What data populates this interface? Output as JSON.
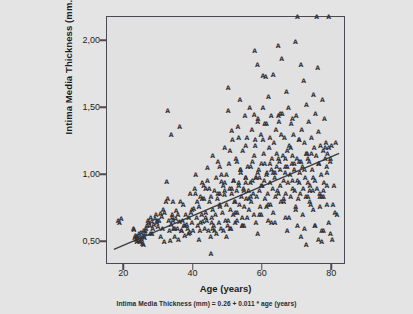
{
  "figure": {
    "background_color": "#e4e4e4",
    "plot_background_color": "#e1e1e1",
    "frame_color": "#4a4a52",
    "marker_color": "#32323a",
    "marker_glyph": "A",
    "caption": "Intima Media Thickness (mm) = 0.26 + 0.011 * age (years)"
  },
  "chart_data": {
    "type": "scatter",
    "title": "",
    "xlabel": "Age (years)",
    "ylabel": "Intima Media Thickness (mm.)",
    "xlim": [
      15,
      84
    ],
    "ylim": [
      0.33,
      2.18
    ],
    "xticks": [
      20,
      40,
      60,
      80
    ],
    "xtick_labels": [
      "20",
      "40",
      "60",
      "80"
    ],
    "yticks": [
      0.5,
      1.0,
      1.5,
      2.0
    ],
    "ytick_labels": [
      "0,50",
      "1,00",
      "1,50",
      "2,00"
    ],
    "grid": false,
    "legend": null,
    "marker": "A",
    "annotations": [
      "Intima Media Thickness (mm) = 0.26 + 0.011 * age (years)"
    ],
    "fit_line": {
      "type": "linear-regression",
      "intercept": 0.26,
      "slope": 0.011,
      "equation": "Intima Media Thickness (mm) = 0.26 + 0.011 * age (years)",
      "x_start": 17,
      "x_end": 82,
      "y_start": 0.447,
      "y_end": 1.162
    },
    "x": [
      18.2,
      18.6,
      19.1,
      22.6,
      22.8,
      23.0,
      23.2,
      23.4,
      23.6,
      23.8,
      24.0,
      24.2,
      24.4,
      24.6,
      24.8,
      25.0,
      25.2,
      25.4,
      25.6,
      25.8,
      26.0,
      26.2,
      26.5,
      26.8,
      27.0,
      27.3,
      27.6,
      27.9,
      28.2,
      28.5,
      28.8,
      29.1,
      29.4,
      29.7,
      30.0,
      30.4,
      30.8,
      31.2,
      31.6,
      32.0,
      32.2,
      32.5,
      32.8,
      33.0,
      33.2,
      33.5,
      33.8,
      34.0,
      34.2,
      34.5,
      34.8,
      35.0,
      35.3,
      35.6,
      35.9,
      36.2,
      36.5,
      36.8,
      37.1,
      37.4,
      37.7,
      38.0,
      38.3,
      38.6,
      38.9,
      39.2,
      39.5,
      39.8,
      40.0,
      40.3,
      40.6,
      40.9,
      41.2,
      41.5,
      41.8,
      42.0,
      42.3,
      42.6,
      42.9,
      43.2,
      43.5,
      43.8,
      44.0,
      44.3,
      44.6,
      44.9,
      45.0,
      45.2,
      45.5,
      45.8,
      46.0,
      46.3,
      46.6,
      46.9,
      47.0,
      47.3,
      47.6,
      47.9,
      48.0,
      48.3,
      48.6,
      48.9,
      49.0,
      49.2,
      49.5,
      49.8,
      50.0,
      50.2,
      50.4,
      50.6,
      50.8,
      51.0,
      51.2,
      51.4,
      51.6,
      51.8,
      52.0,
      52.2,
      52.4,
      52.6,
      52.8,
      53.0,
      53.2,
      53.4,
      53.6,
      53.8,
      54.0,
      54.2,
      54.4,
      54.6,
      54.8,
      55.0,
      55.2,
      55.4,
      55.6,
      55.8,
      56.0,
      56.2,
      56.4,
      56.6,
      56.8,
      57.0,
      57.2,
      57.4,
      57.6,
      57.8,
      58.0,
      58.2,
      58.4,
      58.6,
      58.8,
      59.0,
      59.2,
      59.4,
      59.6,
      59.8,
      60.0,
      60.2,
      60.4,
      60.6,
      60.8,
      61.0,
      61.2,
      61.4,
      61.6,
      61.8,
      62.0,
      62.2,
      62.4,
      62.6,
      62.8,
      63.0,
      63.2,
      63.4,
      63.6,
      63.8,
      64.0,
      64.2,
      64.4,
      64.6,
      64.8,
      65.0,
      65.2,
      65.4,
      65.6,
      65.8,
      66.0,
      66.2,
      66.4,
      66.6,
      66.8,
      67.0,
      67.2,
      67.4,
      67.6,
      67.8,
      68.0,
      68.2,
      68.4,
      68.6,
      68.8,
      69.0,
      69.2,
      69.4,
      69.6,
      69.8,
      70.0,
      70.2,
      70.4,
      70.6,
      70.8,
      71.0,
      71.2,
      71.4,
      71.6,
      71.8,
      72.0,
      72.2,
      72.4,
      72.6,
      72.8,
      73.0,
      73.2,
      73.4,
      73.6,
      73.8,
      74.0,
      74.2,
      74.4,
      74.6,
      74.8,
      75.0,
      75.2,
      75.4,
      75.6,
      75.8,
      76.0,
      76.2,
      76.4,
      76.6,
      76.8,
      77.0,
      77.2,
      77.4,
      77.6,
      77.8,
      78.0,
      78.2,
      78.4,
      78.6,
      79.0,
      79.4,
      79.8,
      80.2,
      80.8,
      81.4,
      33.8,
      34.0,
      36.0,
      33.5,
      32.5,
      50.0,
      51.0,
      53.0,
      57.5,
      57.8,
      58.5,
      60.0,
      60.5,
      62.0,
      64.5,
      65.0,
      65.3,
      68.5,
      70.5,
      72.0,
      75.0,
      77.5,
      45.2,
      50.5,
      52.5,
      54.0,
      55.5,
      58.0,
      59.5,
      61.5,
      63.0,
      66.5,
      69.5,
      71.5,
      73.5,
      76.5,
      78.5,
      40.5,
      42.5,
      44.5,
      46.5,
      48.5,
      49.5,
      51.5,
      53.5,
      55.0,
      56.5,
      58.5,
      60.5,
      62.5,
      64.5,
      66.5,
      68.5,
      70.5,
      72.5,
      74.5,
      76.5,
      78.5,
      41.0,
      43.0,
      45.0,
      47.0,
      49.0,
      51.0,
      53.0,
      55.0,
      57.0,
      59.0,
      61.0,
      63.0,
      65.0,
      67.0,
      69.0,
      71.0,
      73.0,
      75.0,
      77.0,
      79.0,
      28.0,
      29.5,
      31.0,
      35.5,
      37.5,
      39.5,
      43.5,
      47.5,
      52.0,
      56.0,
      61.0,
      66.0,
      71.0,
      76.0,
      79.5,
      24.5,
      26.0,
      30.5,
      34.5,
      38.5,
      42.0,
      46.0,
      50.0,
      54.5,
      59.0,
      63.5,
      67.5,
      72.5,
      77.0,
      80.0,
      23.5,
      25.5,
      27.5,
      31.5,
      36.5,
      41.5,
      45.5,
      49.5,
      54.0,
      58.5,
      62.5,
      67.0,
      70.0,
      74.0,
      78.0,
      81.0,
      45.5,
      50.5,
      55.0,
      60.0,
      64.0,
      68.0,
      72.0,
      76.0,
      79.5,
      47.5,
      52.5,
      57.5,
      62.0,
      66.5,
      70.5,
      74.5,
      78.5,
      44.0,
      48.0,
      53.5,
      58.0,
      63.5,
      68.5,
      73.0,
      77.5,
      80.5,
      39.0,
      43.5,
      49.0,
      54.5,
      59.5,
      64.5,
      69.5,
      73.5,
      77.5,
      37.0,
      42.5,
      47.5,
      52.0,
      56.5,
      61.5,
      66.0,
      70.0,
      75.5,
      79.0
    ],
    "y": [
      0.66,
      0.64,
      0.67,
      0.6,
      0.59,
      0.53,
      0.55,
      0.52,
      0.5,
      0.54,
      0.51,
      0.56,
      0.53,
      0.5,
      0.57,
      0.52,
      0.49,
      0.55,
      0.58,
      0.53,
      0.56,
      0.6,
      0.62,
      0.66,
      0.64,
      0.62,
      0.68,
      0.65,
      0.6,
      0.63,
      0.67,
      0.7,
      0.64,
      0.61,
      0.66,
      0.71,
      0.69,
      0.74,
      0.72,
      0.8,
      0.95,
      0.82,
      0.66,
      0.58,
      0.51,
      0.63,
      0.7,
      0.8,
      0.6,
      0.54,
      0.67,
      0.73,
      0.6,
      0.52,
      0.65,
      0.8,
      0.58,
      0.66,
      0.62,
      0.55,
      0.7,
      0.63,
      0.6,
      0.68,
      0.57,
      0.72,
      0.64,
      0.58,
      0.75,
      0.9,
      1.0,
      0.68,
      0.62,
      0.76,
      0.58,
      0.84,
      0.7,
      0.65,
      0.92,
      0.6,
      0.72,
      0.66,
      1.05,
      0.58,
      0.8,
      0.54,
      0.41,
      0.68,
      0.74,
      0.62,
      0.88,
      0.7,
      0.56,
      0.82,
      1.1,
      0.64,
      0.76,
      0.6,
      0.95,
      0.72,
      0.58,
      0.85,
      1.2,
      0.66,
      0.78,
      0.62,
      1.65,
      1.08,
      0.9,
      0.74,
      0.6,
      0.86,
      1.26,
      0.7,
      0.96,
      0.8,
      0.64,
      1.12,
      0.88,
      0.72,
      1.36,
      0.94,
      0.78,
      1.56,
      1.02,
      0.84,
      0.68,
      1.18,
      0.9,
      0.76,
      1.44,
      0.98,
      0.82,
      1.28,
      1.06,
      0.88,
      0.74,
      1.5,
      0.94,
      0.8,
      1.34,
      1.1,
      0.86,
      0.7,
      1.93,
      1.22,
      0.98,
      0.84,
      1.82,
      1.42,
      1.04,
      0.88,
      0.76,
      1.3,
      1.08,
      0.92,
      1.74,
      1.16,
      0.96,
      0.82,
      1.73,
      1.38,
      1.02,
      0.86,
      1.58,
      1.2,
      0.94,
      0.78,
      1.44,
      1.12,
      0.9,
      1.75,
      1.24,
      0.98,
      0.84,
      1.34,
      1.06,
      0.88,
      1.96,
      1.4,
      1.1,
      0.92,
      0.8,
      1.87,
      1.46,
      1.14,
      0.96,
      1.28,
      1.02,
      0.86,
      1.62,
      1.18,
      0.94,
      1.5,
      1.22,
      1.0,
      0.84,
      1.38,
      1.08,
      0.9,
      1.3,
      1.04,
      0.88,
      1.99,
      1.44,
      1.12,
      0.96,
      0.82,
      1.26,
      1.02,
      0.86,
      1.82,
      1.34,
      1.06,
      0.9,
      1.7,
      1.24,
      0.98,
      0.84,
      1.52,
      1.16,
      0.94,
      1.4,
      1.1,
      0.92,
      0.78,
      1.28,
      1.04,
      0.88,
      1.6,
      1.2,
      0.96,
      1.46,
      1.14,
      0.9,
      1.8,
      1.32,
      1.08,
      0.86,
      1.22,
      1.0,
      0.84,
      1.56,
      1.18,
      0.94,
      1.42,
      1.12,
      1.24,
      1.06,
      1.16,
      1.2,
      1.1,
      1.22,
      0.78,
      0.72,
      0.7,
      0.68,
      0.66,
      1.36,
      1.3,
      1.48,
      1.48,
      1.33,
      1.28,
      1.45,
      1.26,
      1.4,
      1.5,
      1.38,
      1.28,
      1.44,
      1.46,
      1.3,
      1.42,
      1.26,
      0.6,
      0.62,
      0.58,
      0.64,
      0.6,
      0.66,
      0.62,
      0.68,
      0.64,
      0.7,
      0.66,
      0.72,
      0.68,
      0.74,
      0.7,
      0.88,
      0.84,
      0.92,
      0.86,
      0.94,
      0.9,
      0.98,
      0.92,
      1.0,
      0.96,
      1.04,
      0.98,
      1.06,
      1.02,
      1.08,
      1.04,
      1.12,
      1.06,
      1.14,
      1.1,
      1.16,
      0.74,
      0.76,
      0.78,
      0.8,
      0.82,
      0.84,
      0.86,
      0.88,
      0.9,
      0.92,
      0.94,
      0.96,
      0.98,
      1.0,
      1.02,
      1.04,
      1.06,
      1.08,
      1.1,
      1.12,
      0.62,
      0.58,
      0.64,
      0.56,
      0.66,
      0.6,
      0.7,
      0.62,
      0.74,
      0.68,
      0.78,
      0.72,
      0.82,
      0.76,
      0.8,
      0.54,
      0.52,
      0.56,
      0.5,
      0.58,
      0.54,
      0.6,
      0.56,
      0.64,
      0.58,
      0.66,
      0.62,
      0.7,
      0.64,
      0.68,
      0.48,
      0.5,
      0.52,
      0.54,
      0.48,
      0.56,
      0.5,
      0.58,
      0.52,
      0.6,
      0.54,
      0.62,
      0.56,
      0.64,
      0.58,
      0.62,
      1.16,
      1.2,
      1.24,
      1.14,
      1.18,
      1.22,
      1.26,
      1.16,
      1.2,
      1.04,
      1.08,
      1.12,
      1.06,
      1.1,
      1.14,
      1.08,
      1.12,
      0.94,
      0.98,
      1.02,
      0.96,
      1.0,
      1.04,
      0.98,
      1.02,
      0.96,
      0.84,
      0.88,
      0.92,
      0.86,
      0.9,
      0.94,
      0.88,
      0.92,
      0.86,
      0.76,
      0.8,
      0.84,
      0.78,
      0.82,
      0.86,
      0.8,
      0.84,
      0.78,
      0.82
    ]
  }
}
